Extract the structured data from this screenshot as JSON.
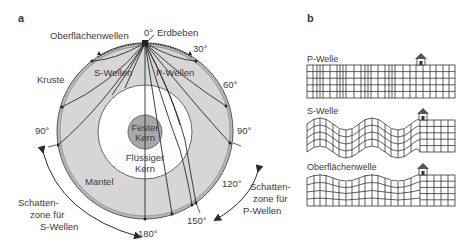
{
  "panel_a": {
    "letter": "a",
    "labels": {
      "surface_waves": "Oberflächenwellen",
      "earthquake": "Erdbeben",
      "crust": "Kruste",
      "s_waves": "S-Wellen",
      "p_waves": "P-Wellen",
      "solid_core_1": "Fester",
      "solid_core_2": "Kern",
      "liquid_core_1": "Flüssiger",
      "liquid_core_2": "Kern",
      "mantle": "Mantel",
      "shadow_s_1": "Schatten-",
      "shadow_s_2": "zone für",
      "shadow_s_3": "S-Wellen",
      "shadow_p_1": "Schatten-",
      "shadow_p_2": "zone für",
      "shadow_p_3": "P-Wellen"
    },
    "angles": {
      "a0": "0°",
      "a30": "30°",
      "a60": "60°",
      "a90_left": "90°",
      "a90_right": "90°",
      "a120": "120°",
      "a150": "150°",
      "a180": "180°"
    },
    "colors": {
      "mantle": "#d6d6d6",
      "crust": "#b8b8b8",
      "liquid_core": "#ffffff",
      "solid_core": "#a8a8a8",
      "lines": "#2a2a2a"
    }
  },
  "panel_b": {
    "letter": "b",
    "rows": [
      {
        "label": "P-Welle"
      },
      {
        "label": "S-Welle"
      },
      {
        "label": "Oberflächenwelle"
      }
    ]
  }
}
